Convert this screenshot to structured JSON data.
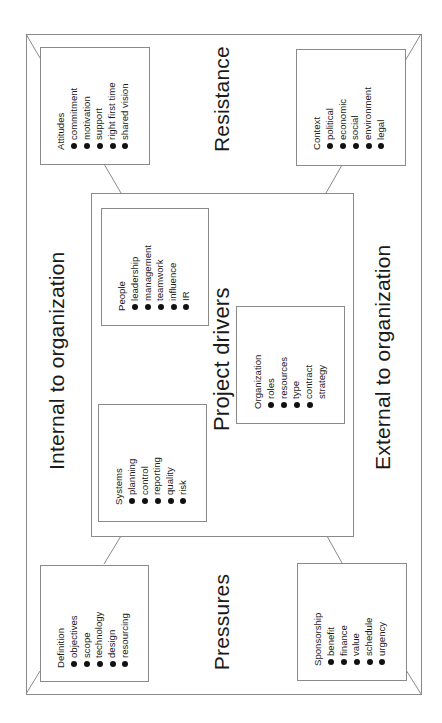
{
  "diagram": {
    "title": "Project drivers",
    "outer_labels": {
      "top": "Resistance",
      "bottom": "Pressures",
      "left": "Internal to organization",
      "right": "External to organization"
    },
    "corner_boxes": {
      "attitudes": {
        "title": "Attitudes",
        "items": [
          "commitment",
          "motivation",
          "support",
          "right first time",
          "shared vision"
        ]
      },
      "context": {
        "title": "Context",
        "items": [
          "political",
          "economic",
          "social",
          "environment",
          "legal"
        ]
      },
      "definition": {
        "title": "Definition",
        "items": [
          "objectives",
          "scope",
          "technology",
          "design",
          "resourcing"
        ]
      },
      "sponsorship": {
        "title": "Sponsorship",
        "items": [
          "benefit",
          "finance",
          "value",
          "schedule",
          "urgency"
        ]
      }
    },
    "inner_boxes": {
      "people": {
        "title": "People",
        "items": [
          "leadership",
          "management",
          "teamwork",
          "influence",
          "IR"
        ]
      },
      "systems": {
        "title": "Systems",
        "items": [
          "planning",
          "control",
          "reporting",
          "quality",
          "risk"
        ]
      },
      "organization": {
        "title": "Organization",
        "items": [
          "roles",
          "resources",
          "type",
          "contract",
          "strategy"
        ],
        "bullets": [
          true,
          true,
          true,
          true,
          false
        ]
      }
    },
    "colors": {
      "line": "#8a8a8a",
      "text": "#1a1a1a",
      "background": "#ffffff"
    }
  }
}
